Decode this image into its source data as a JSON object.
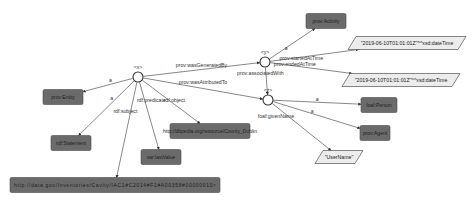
{
  "diagram": {
    "type": "rdf-provenance-graph",
    "blank_nodes": [
      {
        "id": "x",
        "label": "<x>"
      },
      {
        "id": "y",
        "label": "<y>"
      },
      {
        "id": "z",
        "label": "<z>"
      }
    ],
    "resource_nodes": [
      {
        "id": "prov_entity",
        "label": "prov:Entity"
      },
      {
        "id": "rdf_statement",
        "label": "rdf:Statement"
      },
      {
        "id": "var_lastvalue",
        "label": "var:lastValue"
      },
      {
        "id": "subject_uri",
        "label": "http://data.gov/Inventories/Cavity/IAC1#C2014#F1#A00358#00000010>"
      },
      {
        "id": "object_uri",
        "label": "http://dbpedia.org/resource/County_Dublin"
      },
      {
        "id": "prov_activity",
        "label": "prov:Activity"
      },
      {
        "id": "foaf_person",
        "label": "foaf:Person"
      },
      {
        "id": "prov_agent",
        "label": "prov:Agent"
      }
    ],
    "literal_nodes": [
      {
        "id": "start_time",
        "label": "\"2019-06-10T01:01:01Z\"^^xsd:dateTime"
      },
      {
        "id": "end_time",
        "label": "\"2019-06-10T01:01:01Z\"^^xsd:dateTime"
      },
      {
        "id": "username",
        "label": "\"UserName\""
      }
    ],
    "edges": [
      {
        "from": "x",
        "to": "prov_entity",
        "label": "a"
      },
      {
        "from": "x",
        "to": "rdf_statement",
        "label": "a"
      },
      {
        "from": "x",
        "to": "subject_uri",
        "label": "rdf:subject"
      },
      {
        "from": "x",
        "to": "var_lastvalue",
        "label": "rdf:predicate"
      },
      {
        "from": "x",
        "to": "object_uri",
        "label": "rdf:object"
      },
      {
        "from": "x",
        "to": "y",
        "label": "prov:wasGeneratedBy"
      },
      {
        "from": "x",
        "to": "z",
        "label": "prov:wasAttributedTo"
      },
      {
        "from": "y",
        "to": "prov_activity",
        "label": "a"
      },
      {
        "from": "y",
        "to": "start_time",
        "label": "prov:startedAtTime"
      },
      {
        "from": "y",
        "to": "end_time",
        "label": "prov:endedAtTime"
      },
      {
        "from": "y",
        "to": "z",
        "label": "prov:associatedWith"
      },
      {
        "from": "z",
        "to": "foaf_person",
        "label": "a"
      },
      {
        "from": "z",
        "to": "prov_agent",
        "label": "a"
      },
      {
        "from": "z",
        "to": "username",
        "label": "foaf:givenName"
      }
    ]
  }
}
